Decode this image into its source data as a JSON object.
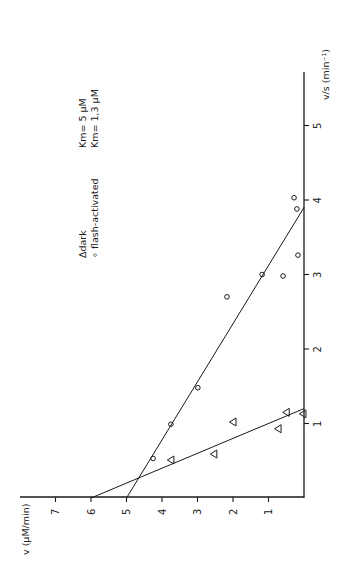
{
  "chart_data": {
    "type": "scatter",
    "title": "",
    "orientation": "rotated 90deg counter-clockwise (Eadie-Hofstee plot)",
    "xlabel": "v/s (min⁻¹)",
    "ylabel": "v (μM/min)",
    "xlim": [
      0,
      5.5
    ],
    "ylim": [
      0,
      7.5
    ],
    "x_ticks": [
      "1",
      "2",
      "3",
      "4",
      "5"
    ],
    "y_ticks": [
      "1",
      "2",
      "3",
      "4",
      "5",
      "6",
      "7"
    ],
    "grid": false,
    "legend": [
      {
        "marker": "Δ",
        "label": "dark",
        "annotation": "Km= 5  μM"
      },
      {
        "marker": "∘",
        "label": "flash-activated",
        "annotation": "Km= 1,3 μM"
      }
    ],
    "series": [
      {
        "name": "dark",
        "marker": "triangle",
        "points": [
          {
            "x": 0.51,
            "y": 3.75
          },
          {
            "x": 0.59,
            "y": 2.54
          },
          {
            "x": 1.02,
            "y": 2.0
          },
          {
            "x": 0.93,
            "y": 0.73
          },
          {
            "x": 1.15,
            "y": 0.5
          },
          {
            "x": 1.13,
            "y": 0.03
          }
        ],
        "fit_line": {
          "y_intercept": 6.0,
          "x_intercept": 1.2
        }
      },
      {
        "name": "flash-activated",
        "marker": "circle",
        "points": [
          {
            "x": 0.53,
            "y": 4.25
          },
          {
            "x": 0.99,
            "y": 3.75
          },
          {
            "x": 1.48,
            "y": 2.99
          },
          {
            "x": 2.7,
            "y": 2.17
          },
          {
            "x": 3.0,
            "y": 1.18
          },
          {
            "x": 2.98,
            "y": 0.59
          },
          {
            "x": 3.26,
            "y": 0.17
          },
          {
            "x": 3.88,
            "y": 0.2
          },
          {
            "x": 4.03,
            "y": 0.28
          }
        ],
        "fit_line": {
          "y_intercept": 5.0,
          "x_intercept": 3.9
        }
      }
    ]
  },
  "labels": {
    "x_axis": "v/s (min⁻¹)",
    "y_axis": "v (μM/min)",
    "legend_dark": "Δdark",
    "legend_flash": "∘ flash-activated",
    "km_dark": "Km= 5  μM",
    "km_flash": "Km= 1,3 μM"
  }
}
